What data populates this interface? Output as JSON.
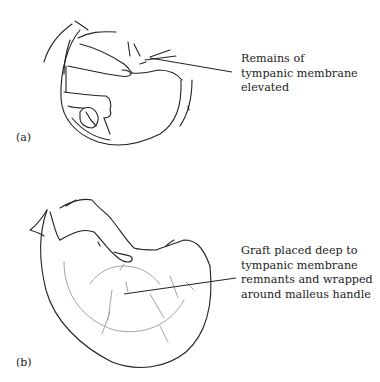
{
  "figure": {
    "panels": [
      {
        "id": "a",
        "tag": "(a)",
        "annotation_lines": [
          "Remains of",
          "tympanic membrane",
          "elevated"
        ]
      },
      {
        "id": "b",
        "tag": "(b)",
        "annotation_lines": [
          "Graft placed deep to",
          "tympanic membrane",
          "remnants and wrapped",
          "around malleus handle"
        ]
      }
    ],
    "colors": {
      "ink": "#222222",
      "faint_ink": "#9a9a9a",
      "background": "#ffffff"
    }
  }
}
